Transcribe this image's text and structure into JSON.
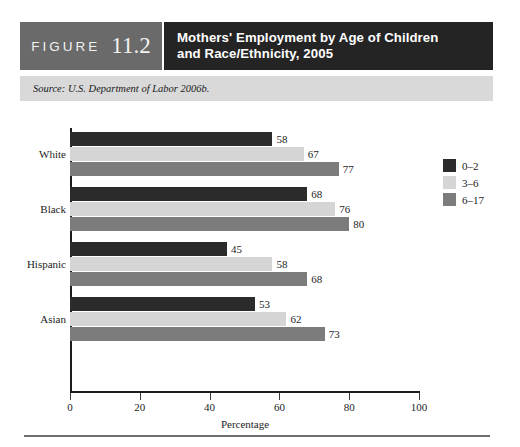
{
  "figure": {
    "label": "FIGURE",
    "number": "11.2",
    "title_line1": "Mothers' Employment by Age of Children",
    "title_line2": "and Race/Ethnicity, 2005",
    "source": "Source: U.S. Department of Labor 2006b."
  },
  "colors": {
    "figure_block_bg": "#6a6a6a",
    "title_block_bg": "#242424",
    "source_bar_bg": "#d9d9d9",
    "series_0_2": "#2b2b2b",
    "series_3_6": "#d5d5d5",
    "series_6_17": "#7c7c7c",
    "axis": "#1d1d1d",
    "rule": "#6e6e6e"
  },
  "chart_data": {
    "type": "bar",
    "orientation": "horizontal",
    "title": "Mothers' Employment by Age of Children and Race/Ethnicity, 2005",
    "xlabel": "Percentage",
    "ylabel": "",
    "xlim": [
      0,
      100
    ],
    "xticks": [
      0,
      20,
      40,
      60,
      80,
      100
    ],
    "xtick_labels": [
      "0",
      "20",
      "40",
      "60",
      "80",
      "100"
    ],
    "grid": false,
    "legend_position": "right",
    "categories": [
      "White",
      "Black",
      "Hispanic",
      "Asian"
    ],
    "series": [
      {
        "name": "0–2",
        "color": "#2b2b2b",
        "values": [
          58,
          68,
          45,
          53
        ]
      },
      {
        "name": "3–6",
        "color": "#d5d5d5",
        "values": [
          67,
          76,
          58,
          62
        ]
      },
      {
        "name": "6–17",
        "color": "#7c7c7c",
        "values": [
          77,
          80,
          68,
          73
        ]
      }
    ],
    "data_labels": [
      {
        "category": "White",
        "series": "0–2",
        "value": 58
      },
      {
        "category": "White",
        "series": "3–6",
        "value": 67
      },
      {
        "category": "White",
        "series": "6–17",
        "value": 77
      },
      {
        "category": "Black",
        "series": "0–2",
        "value": 68
      },
      {
        "category": "Black",
        "series": "3–6",
        "value": 76
      },
      {
        "category": "Black",
        "series": "6–17",
        "value": 80
      },
      {
        "category": "Hispanic",
        "series": "0–2",
        "value": 45
      },
      {
        "category": "Hispanic",
        "series": "3–6",
        "value": 58
      },
      {
        "category": "Hispanic",
        "series": "6–17",
        "value": 68
      },
      {
        "category": "Asian",
        "series": "0–2",
        "value": 53
      },
      {
        "category": "Asian",
        "series": "3–6",
        "value": 62
      },
      {
        "category": "Asian",
        "series": "6–17",
        "value": 73
      }
    ]
  }
}
